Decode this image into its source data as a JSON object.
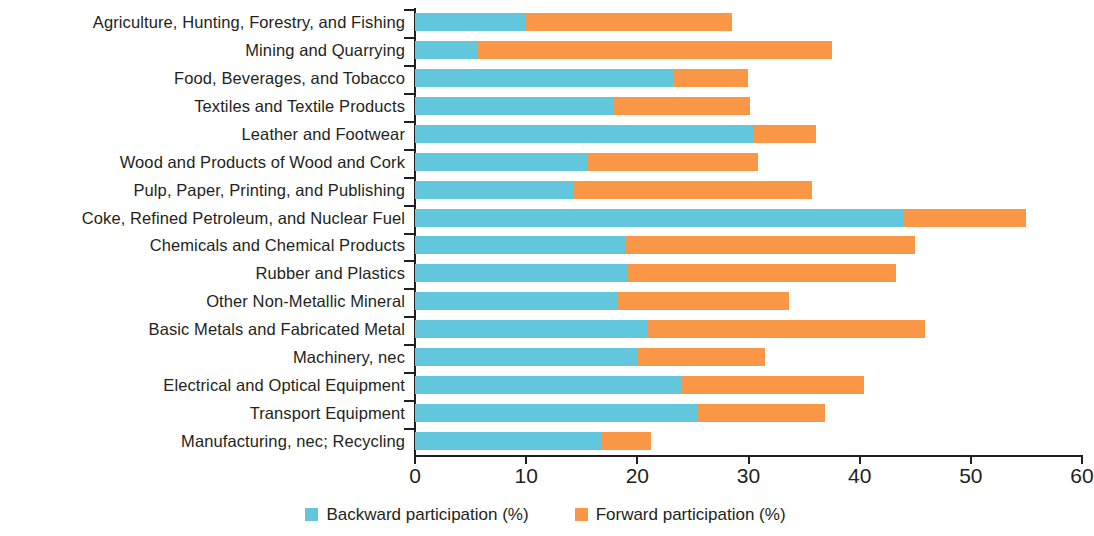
{
  "chart_data": {
    "type": "bar",
    "orientation": "horizontal",
    "stacked": true,
    "title": "",
    "subtitle": "",
    "xlabel": "",
    "ylabel": "",
    "xlim": [
      0,
      60
    ],
    "xticks": [
      0,
      10,
      20,
      30,
      40,
      50,
      60
    ],
    "xtick_labels": [
      "0",
      "10",
      "20",
      "30",
      "40",
      "50",
      "60"
    ],
    "grid": false,
    "legend_position": "bottom",
    "categories": [
      "Agriculture, Hunting, Forestry, and Fishing",
      "Mining and Quarrying",
      "Food, Beverages, and Tobacco",
      "Textiles and Textile Products",
      "Leather and Footwear",
      "Wood and Products of Wood and Cork",
      "Pulp, Paper, Printing, and Publishing",
      "Coke, Refined Petroleum, and Nuclear Fuel",
      "Chemicals and Chemical Products",
      "Rubber and Plastics",
      "Other Non-Metallic Mineral",
      "Basic Metals and Fabricated Metal",
      "Machinery, nec",
      "Electrical and Optical Equipment",
      "Transport Equipment",
      "Manufacturing, nec; Recycling"
    ],
    "series": [
      {
        "name": "Backward participation (%)",
        "color": "#62c6dd",
        "values": [
          10.0,
          5.7,
          23.2,
          17.8,
          30.4,
          15.6,
          14.3,
          44.0,
          19.0,
          19.2,
          18.3,
          21.0,
          20.1,
          23.9,
          25.5,
          16.7
        ]
      },
      {
        "name": "Forward participation (%)",
        "color": "#f99746",
        "values": [
          18.5,
          31.8,
          6.8,
          12.3,
          5.7,
          15.3,
          21.4,
          11.0,
          26.0,
          24.1,
          15.3,
          24.9,
          11.4,
          16.5,
          11.4,
          4.5
        ]
      }
    ],
    "totals": [
      28.5,
      37.5,
      30.0,
      30.1,
      36.1,
      30.9,
      35.7,
      55.0,
      45.0,
      43.3,
      33.6,
      45.9,
      31.5,
      40.4,
      36.9,
      21.2
    ]
  },
  "legend": {
    "items": [
      {
        "label": "Backward participation (%)",
        "color": "#62c6dd"
      },
      {
        "label": "Forward participation (%)",
        "color": "#f99746"
      }
    ]
  }
}
